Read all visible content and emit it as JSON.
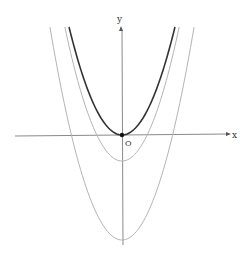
{
  "chart_data": {
    "type": "line",
    "title": "",
    "xlabel": "x",
    "ylabel": "y",
    "origin_label": "O",
    "grid": false,
    "legend": "none",
    "series": [
      {
        "name": "y = x^2",
        "vertex": [
          0,
          0
        ],
        "color": "#333333",
        "width": 1.6
      },
      {
        "name": "y = x^2 - k (middle)",
        "vertex": [
          0,
          -26
        ],
        "color": "#b0b0b0",
        "width": 1
      },
      {
        "name": "y = x^2 - m (outer)",
        "vertex": [
          0,
          -105
        ],
        "color": "#b0b0b0",
        "width": 1
      }
    ]
  },
  "axes": {
    "x_label": "x",
    "y_label": "y",
    "origin_label": "O",
    "axis_color": "#888888"
  }
}
